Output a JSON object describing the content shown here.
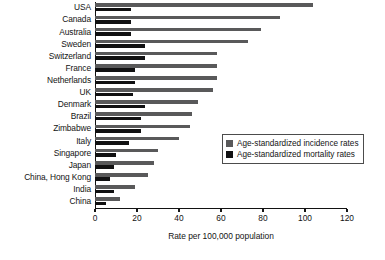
{
  "chart_data": {
    "type": "bar",
    "orientation": "horizontal",
    "title": "",
    "xlabel": "Rate per 100,000 population",
    "ylabel": "",
    "xlim": [
      0,
      120
    ],
    "xticks": [
      0,
      20,
      40,
      60,
      80,
      100,
      120
    ],
    "grid": false,
    "legend_position": "center-right",
    "categories": [
      "USA",
      "Canada",
      "Australia",
      "Sweden",
      "Switzerland",
      "France",
      "Netherlands",
      "UK",
      "Denmark",
      "Brazil",
      "Zimbabwe",
      "Italy",
      "Singapore",
      "Japan",
      "China, Hong Kong",
      "India",
      "China"
    ],
    "series": [
      {
        "name": "Age-standardized incidence rates",
        "color": "#59595a",
        "values": [
          104,
          88,
          79,
          73,
          58,
          58,
          58,
          56,
          49,
          46,
          45,
          40,
          30,
          28,
          25,
          19,
          12
        ]
      },
      {
        "name": "Age-standardized mortality rates",
        "color": "#111112",
        "values": [
          17,
          17,
          17,
          24,
          24,
          19,
          19,
          18,
          24,
          22,
          22,
          16,
          10,
          9,
          7,
          9,
          5
        ]
      }
    ]
  },
  "legend": {
    "items": [
      {
        "label": "Age-standardized incidence rates",
        "swatch": "incidence-swatch"
      },
      {
        "label": "Age-standardized mortality rates",
        "swatch": "mortality-swatch"
      }
    ]
  }
}
